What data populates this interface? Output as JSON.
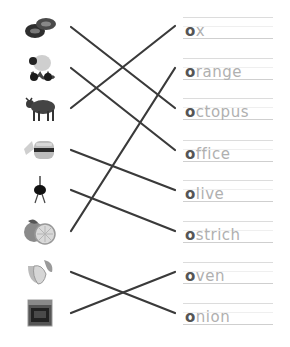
{
  "worksheet": {
    "pictures": [
      {
        "name": "shoes",
        "icon": "shoes-icon"
      },
      {
        "name": "octopus",
        "icon": "octopus-icon"
      },
      {
        "name": "ox",
        "icon": "ox-icon"
      },
      {
        "name": "office",
        "icon": "office-icon"
      },
      {
        "name": "ostrich",
        "icon": "ostrich-icon"
      },
      {
        "name": "orange",
        "icon": "orange-icon"
      },
      {
        "name": "onion",
        "icon": "onion-icon"
      },
      {
        "name": "oven",
        "icon": "oven-icon"
      }
    ],
    "words": [
      {
        "first": "o",
        "rest": "x"
      },
      {
        "first": "o",
        "rest": "range"
      },
      {
        "first": "o",
        "rest": "ctopus"
      },
      {
        "first": "o",
        "rest": "ffice"
      },
      {
        "first": "o",
        "rest": "live"
      },
      {
        "first": "o",
        "rest": "strich"
      },
      {
        "first": "o",
        "rest": "ven"
      },
      {
        "first": "o",
        "rest": "nion"
      }
    ],
    "line_color": "#333333",
    "word_color": "#b0b0b0",
    "first_letter_color": "#555555"
  }
}
